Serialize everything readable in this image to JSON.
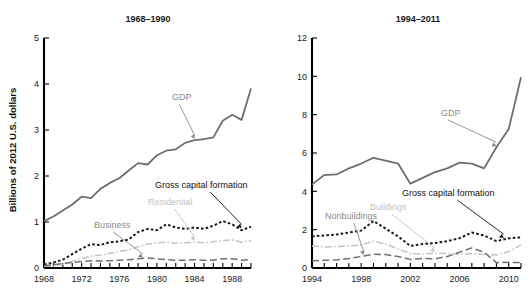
{
  "figure": {
    "shared_ylabel": "Billions of 2012 U.S. dollars",
    "background": "#ffffff"
  },
  "colors": {
    "gdp": "#6e6e6e",
    "gross_capital_formation": "#1a1a1a",
    "residential_buildings": "#c3c3c3",
    "business_nonbuildings": "#707070",
    "axis": "#000000",
    "text": "#1a1a1a"
  },
  "chart_data": [
    {
      "type": "line",
      "panel": "left",
      "title": "1968–1990",
      "xlabel": "",
      "ylabel": "Billions of 2012 U.S. dollars",
      "xlim": [
        1968,
        1990
      ],
      "ylim": [
        0,
        5
      ],
      "yticks": [
        0,
        1,
        2,
        3,
        4,
        5
      ],
      "ytick_labels": [
        "0",
        "1",
        "2",
        "3",
        "4",
        "5"
      ],
      "xticks": [
        1968,
        1969,
        1970,
        1971,
        1972,
        1973,
        1974,
        1975,
        1976,
        1977,
        1978,
        1979,
        1980,
        1981,
        1982,
        1983,
        1984,
        1985,
        1986,
        1987,
        1988,
        1989,
        1990
      ],
      "xtick_labels_shown": [
        "1968",
        "1972",
        "1976",
        "1980",
        "1984",
        "1988"
      ],
      "xtick_labels_at": [
        1968,
        1972,
        1976,
        1980,
        1984,
        1988
      ],
      "grid": false,
      "legend": "none",
      "x": [
        1968,
        1969,
        1970,
        1971,
        1972,
        1973,
        1974,
        1975,
        1976,
        1977,
        1978,
        1979,
        1980,
        1981,
        1982,
        1983,
        1984,
        1985,
        1986,
        1987,
        1988,
        1989,
        1990
      ],
      "series": [
        {
          "name": "GDP",
          "style": "solid",
          "color": "#6e6e6e",
          "values": [
            1.02,
            1.12,
            1.25,
            1.38,
            1.55,
            1.52,
            1.72,
            1.85,
            1.95,
            2.12,
            2.28,
            2.25,
            2.45,
            2.55,
            2.58,
            2.72,
            2.78,
            2.8,
            2.84,
            3.2,
            3.33,
            3.22,
            3.9
          ]
        },
        {
          "name": "Gross capital formation",
          "style": "dotted",
          "color": "#1a1a1a",
          "values": [
            0.08,
            0.12,
            0.18,
            0.3,
            0.42,
            0.52,
            0.5,
            0.56,
            0.58,
            0.62,
            0.78,
            0.85,
            0.82,
            0.95,
            0.88,
            0.85,
            0.88,
            0.85,
            0.92,
            1.02,
            0.95,
            0.82,
            0.9
          ]
        },
        {
          "name": "Residential",
          "style": "dashdot",
          "color": "#c3c3c3",
          "values": [
            0.03,
            0.05,
            0.08,
            0.14,
            0.2,
            0.26,
            0.28,
            0.32,
            0.36,
            0.4,
            0.46,
            0.52,
            0.55,
            0.56,
            0.54,
            0.55,
            0.56,
            0.55,
            0.57,
            0.6,
            0.61,
            0.56,
            0.6
          ]
        },
        {
          "name": "Business",
          "style": "longdash",
          "color": "#707070",
          "values": [
            0.05,
            0.07,
            0.1,
            0.12,
            0.14,
            0.16,
            0.15,
            0.16,
            0.17,
            0.18,
            0.2,
            0.22,
            0.2,
            0.18,
            0.17,
            0.17,
            0.18,
            0.17,
            0.17,
            0.2,
            0.2,
            0.17,
            0.18
          ]
        }
      ],
      "annotations": [
        {
          "label": "GDP",
          "color": "#8a8a8a",
          "point_x": 1984,
          "point_y": 2.78
        },
        {
          "label": "Gross capital formation",
          "color": "#1a1a1a",
          "point_x": 1989,
          "point_y": 0.84
        },
        {
          "label": "Residential",
          "color": "#c3c3c3",
          "point_x": 1984,
          "point_y": 0.57
        },
        {
          "label": "Business",
          "color": "#8a8a8a",
          "point_x": 1978.5,
          "point_y": 0.2
        }
      ]
    },
    {
      "type": "line",
      "panel": "right",
      "title": "1994–2011",
      "xlabel": "",
      "ylabel": "",
      "xlim": [
        1994,
        2011
      ],
      "ylim": [
        0,
        12
      ],
      "yticks": [
        0,
        2,
        4,
        6,
        8,
        10,
        12
      ],
      "ytick_labels": [
        "0",
        "2",
        "4",
        "6",
        "8",
        "10",
        "12"
      ],
      "xticks": [
        1994,
        1995,
        1996,
        1997,
        1998,
        1999,
        2000,
        2001,
        2002,
        2003,
        2004,
        2005,
        2006,
        2007,
        2008,
        2009,
        2010,
        2011
      ],
      "xtick_labels_shown": [
        "1994",
        "1998",
        "2002",
        "2006",
        "2010"
      ],
      "xtick_labels_at": [
        1994,
        1998,
        2002,
        2006,
        2010
      ],
      "grid": false,
      "legend": "none",
      "x": [
        1994,
        1995,
        1996,
        1997,
        1998,
        1999,
        2000,
        2001,
        2002,
        2003,
        2004,
        2005,
        2006,
        2007,
        2008,
        2009,
        2010,
        2011
      ],
      "series": [
        {
          "name": "GDP",
          "style": "solid",
          "color": "#6e6e6e",
          "values": [
            4.35,
            4.85,
            4.88,
            5.2,
            5.45,
            5.75,
            5.6,
            5.45,
            4.4,
            4.7,
            5.0,
            5.2,
            5.5,
            5.45,
            5.2,
            6.3,
            7.25,
            9.95
          ]
        },
        {
          "name": "Gross capital formation",
          "style": "dotted",
          "color": "#1a1a1a",
          "values": [
            1.65,
            1.7,
            1.75,
            1.85,
            1.95,
            2.45,
            2.05,
            1.65,
            1.15,
            1.25,
            1.3,
            1.4,
            1.55,
            1.85,
            1.7,
            1.4,
            1.55,
            1.6
          ]
        },
        {
          "name": "Buildings",
          "style": "dashdot",
          "color": "#c3c3c3",
          "values": [
            1.15,
            1.1,
            1.12,
            1.15,
            1.2,
            1.4,
            1.25,
            1.0,
            0.75,
            0.72,
            0.78,
            0.75,
            0.72,
            0.75,
            0.7,
            0.68,
            0.85,
            1.2
          ]
        },
        {
          "name": "Nonbuildings",
          "style": "longdash",
          "color": "#707070",
          "values": [
            0.38,
            0.4,
            0.42,
            0.5,
            0.6,
            0.72,
            0.7,
            0.6,
            0.45,
            0.5,
            0.48,
            0.6,
            0.82,
            1.05,
            0.82,
            0.28,
            0.3,
            0.28
          ]
        }
      ],
      "annotations": [
        {
          "label": "GDP",
          "color": "#8a8a8a",
          "point_x": 2009,
          "point_y": 6.3
        },
        {
          "label": "Gross capital formation",
          "color": "#1a1a1a",
          "point_x": 2009.6,
          "point_y": 1.5
        },
        {
          "label": "Buildings",
          "color": "#c3c3c3",
          "point_x": 2004,
          "point_y": 0.78
        },
        {
          "label": "Nonbuildings",
          "color": "#8a8a8a",
          "point_x": 1998.2,
          "point_y": 0.62
        }
      ]
    }
  ]
}
